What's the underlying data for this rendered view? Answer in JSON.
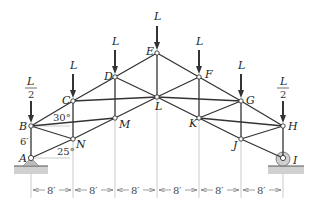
{
  "diagram": {
    "type": "roof truss",
    "nodes": {
      "A": {
        "label": "A",
        "x": 31,
        "y": 158
      },
      "B": {
        "label": "B",
        "x": 31,
        "y": 126
      },
      "C": {
        "label": "C",
        "x": 73,
        "y": 101
      },
      "D": {
        "label": "D",
        "x": 115,
        "y": 77
      },
      "E": {
        "label": "E",
        "x": 157,
        "y": 53
      },
      "F": {
        "label": "F",
        "x": 199,
        "y": 77
      },
      "G": {
        "label": "G",
        "x": 241,
        "y": 101
      },
      "H": {
        "label": "H",
        "x": 283,
        "y": 126
      },
      "I": {
        "label": "I",
        "x": 283,
        "y": 158
      },
      "J": {
        "label": "J",
        "x": 241,
        "y": 139
      },
      "K": {
        "label": "K",
        "x": 199,
        "y": 118
      },
      "L": {
        "label": "L",
        "x": 157,
        "y": 97
      },
      "M": {
        "label": "M",
        "x": 115,
        "y": 118
      },
      "N": {
        "label": "N",
        "x": 73,
        "y": 139
      }
    },
    "members": [
      [
        "A",
        "B"
      ],
      [
        "B",
        "C"
      ],
      [
        "C",
        "D"
      ],
      [
        "D",
        "E"
      ],
      [
        "E",
        "F"
      ],
      [
        "F",
        "G"
      ],
      [
        "G",
        "H"
      ],
      [
        "H",
        "I"
      ],
      [
        "A",
        "N"
      ],
      [
        "N",
        "M"
      ],
      [
        "M",
        "L"
      ],
      [
        "L",
        "K"
      ],
      [
        "K",
        "J"
      ],
      [
        "J",
        "I"
      ],
      [
        "B",
        "N"
      ],
      [
        "B",
        "M"
      ],
      [
        "C",
        "N"
      ],
      [
        "C",
        "L"
      ],
      [
        "D",
        "M"
      ],
      [
        "D",
        "L"
      ],
      [
        "E",
        "L"
      ],
      [
        "F",
        "L"
      ],
      [
        "F",
        "K"
      ],
      [
        "G",
        "L"
      ],
      [
        "G",
        "K"
      ],
      [
        "G",
        "J"
      ],
      [
        "H",
        "K"
      ],
      [
        "H",
        "J"
      ]
    ],
    "loads": [
      {
        "node": "B",
        "label_num": "L",
        "label_den": "2",
        "fraction": true
      },
      {
        "node": "C",
        "label": "L"
      },
      {
        "node": "D",
        "label": "L"
      },
      {
        "node": "E",
        "label": "L"
      },
      {
        "node": "F",
        "label": "L"
      },
      {
        "node": "G",
        "label": "L"
      },
      {
        "node": "H",
        "label_num": "L",
        "label_den": "2",
        "fraction": true
      }
    ],
    "annotations": {
      "angle_top": "30°",
      "angle_bottom": "25°",
      "height_AB": "6′"
    },
    "supports": {
      "left": {
        "node": "A",
        "type": "pin"
      },
      "right": {
        "node": "I",
        "type": "roller"
      }
    },
    "dimensions": {
      "panel_labels": [
        "8′",
        "8′",
        "8′",
        "8′",
        "8′",
        "8′"
      ]
    }
  }
}
